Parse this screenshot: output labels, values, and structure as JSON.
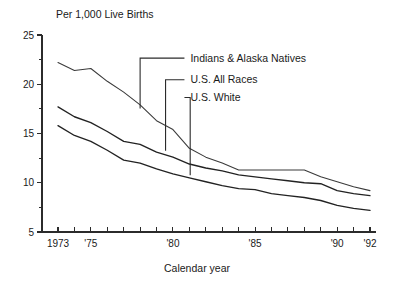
{
  "chart_data": {
    "type": "line",
    "title": "",
    "unit_caption": "Per 1,000 Live Births",
    "xlabel": "Calendar year",
    "ylabel": "",
    "xlim": [
      1973,
      1992
    ],
    "ylim": [
      5,
      25
    ],
    "grid": false,
    "legend_position": "inline-leader-labels",
    "y_ticks_major": [
      5,
      10,
      15,
      20,
      25
    ],
    "y_tick_labels": [
      "5",
      "10",
      "15",
      "20",
      "25"
    ],
    "y_ticks_minor": [
      7.5,
      12.5,
      17.5,
      22.5
    ],
    "x_ticks": [
      1973,
      1974,
      1975,
      1976,
      1977,
      1978,
      1979,
      1980,
      1981,
      1982,
      1983,
      1984,
      1985,
      1986,
      1987,
      1988,
      1989,
      1990,
      1991,
      1992
    ],
    "x_tick_labels": [
      {
        "x": 1973,
        "label": "1973"
      },
      {
        "x": 1975,
        "label": "'75"
      },
      {
        "x": 1980,
        "label": "'80"
      },
      {
        "x": 1985,
        "label": "'85"
      },
      {
        "x": 1990,
        "label": "'90"
      },
      {
        "x": 1992,
        "label": "'92"
      }
    ],
    "x": [
      1973,
      1974,
      1975,
      1976,
      1977,
      1978,
      1979,
      1980,
      1981,
      1982,
      1983,
      1984,
      1985,
      1986,
      1987,
      1988,
      1989,
      1990,
      1991,
      1992
    ],
    "series": [
      {
        "name": "Indians & Alaska Natives",
        "style": "thin",
        "values": [
          22.2,
          21.4,
          21.6,
          20.3,
          19.2,
          17.9,
          16.3,
          15.4,
          13.5,
          12.6,
          12.0,
          11.3,
          11.3,
          11.3,
          11.3,
          11.3,
          10.6,
          10.1,
          9.6,
          9.2
        ]
      },
      {
        "name": "U.S. All Races",
        "style": "bold",
        "values": [
          17.7,
          16.7,
          16.1,
          15.2,
          14.2,
          13.9,
          13.1,
          12.6,
          11.9,
          11.5,
          11.2,
          10.8,
          10.6,
          10.4,
          10.2,
          10.0,
          9.9,
          9.2,
          8.9,
          8.7
        ]
      },
      {
        "name": "U.S. White",
        "style": "bold",
        "values": [
          15.8,
          14.8,
          14.2,
          13.3,
          12.3,
          12.0,
          11.4,
          10.9,
          10.5,
          10.1,
          9.7,
          9.4,
          9.3,
          8.9,
          8.7,
          8.5,
          8.2,
          7.7,
          7.4,
          7.2
        ]
      }
    ],
    "annotations": [
      {
        "label": "Indians & Alaska Natives",
        "anchor_x": 1978.0,
        "anchor_y": 17.55,
        "elbow_y_value": 22.65,
        "text_x": 1980.7,
        "text_y_value": 22.65
      },
      {
        "label": "U.S. All Races",
        "anchor_x": 1979.55,
        "anchor_y": 13.25,
        "elbow_y_value": 20.45,
        "text_x": 1980.7,
        "text_y_value": 20.45
      },
      {
        "label": "U.S. White",
        "anchor_x": 1981.05,
        "anchor_y": 10.75,
        "elbow_y_value": 18.65,
        "text_x": 1980.7,
        "text_y_value": 18.65
      }
    ]
  },
  "page": {
    "background_color": "#ffffff",
    "ink_color": "#1a1a1a"
  }
}
